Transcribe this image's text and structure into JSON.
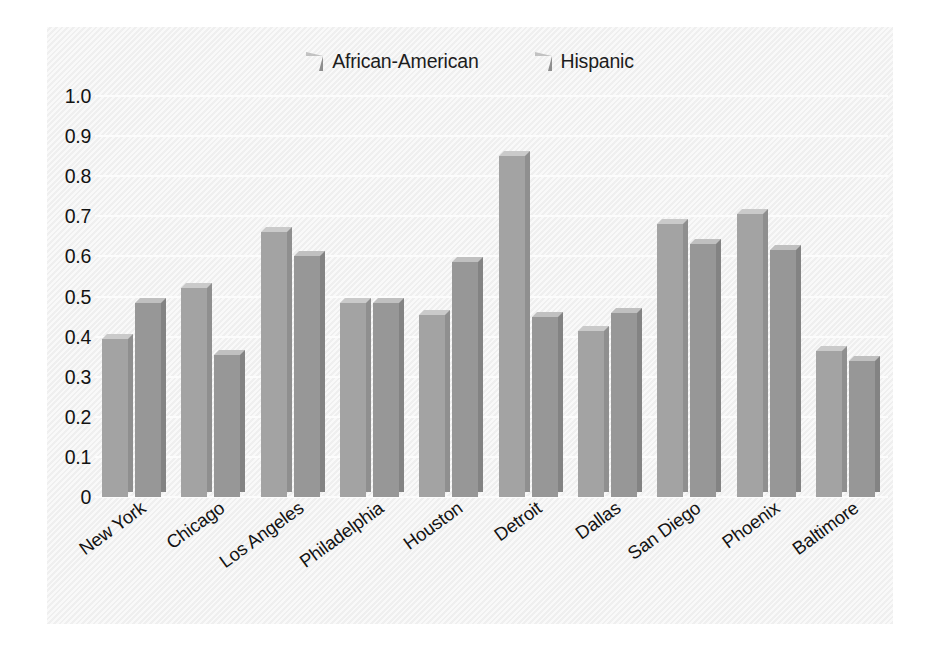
{
  "chart_data": {
    "type": "bar",
    "title": "",
    "subtitle": "",
    "xlabel": "",
    "ylabel": "",
    "categories": [
      "New York",
      "Chicago",
      "Los Angeles",
      "Philadelphia",
      "Houston",
      "Detroit",
      "Dallas",
      "San Diego",
      "Phoenix",
      "Baltimore"
    ],
    "series": [
      {
        "name": "African-American",
        "color": "#a3a3a3",
        "values": [
          0.395,
          0.52,
          0.66,
          0.485,
          0.455,
          0.85,
          0.415,
          0.68,
          0.705,
          0.365
        ]
      },
      {
        "name": "Hispanic",
        "color": "#979797",
        "values": [
          0.485,
          0.355,
          0.6,
          0.485,
          0.585,
          0.45,
          0.46,
          0.63,
          0.615,
          0.34
        ]
      }
    ],
    "ylim": [
      0,
      1.0
    ],
    "ytick_labels": [
      "1.0",
      "0.9",
      "0.8",
      "0.7",
      "0.6",
      "0.5",
      "0.4",
      "0.3",
      "0.2",
      "0.1",
      "0"
    ],
    "ytick_values": [
      1.0,
      0.9,
      0.8,
      0.7,
      0.6,
      0.5,
      0.4,
      0.3,
      0.2,
      0.1,
      0
    ],
    "grid": true,
    "grid_color": "#fcfcfc",
    "legend_position": "top-right",
    "plot_background": "#f2f2f2",
    "style": "3d-bars"
  }
}
